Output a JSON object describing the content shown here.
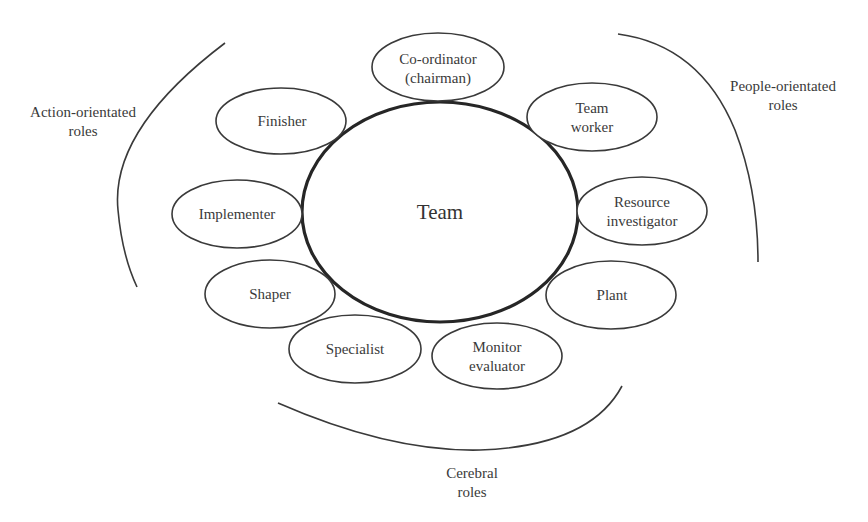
{
  "diagram": {
    "center": {
      "label": "Team"
    },
    "groups": {
      "action": {
        "line1": "Action-orientated",
        "line2": "roles"
      },
      "people": {
        "line1": "People-orientated",
        "line2": "roles"
      },
      "cerebral": {
        "line1": "Cerebral",
        "line2": "roles"
      }
    },
    "roles": {
      "coordinator": {
        "line1": "Co-ordinator",
        "line2": "(chairman)",
        "group": "people"
      },
      "team_worker": {
        "line1": "Team",
        "line2": "worker",
        "group": "people"
      },
      "resource_investigator": {
        "line1": "Resource",
        "line2": "investigator",
        "group": "people"
      },
      "plant": {
        "line1": "Plant",
        "group": "cerebral"
      },
      "monitor_evaluator": {
        "line1": "Monitor",
        "line2": "evaluator",
        "group": "cerebral"
      },
      "specialist": {
        "line1": "Specialist",
        "group": "cerebral"
      },
      "shaper": {
        "line1": "Shaper",
        "group": "action"
      },
      "implementer": {
        "line1": "Implementer",
        "group": "action"
      },
      "finisher": {
        "line1": "Finisher",
        "group": "action"
      }
    }
  }
}
